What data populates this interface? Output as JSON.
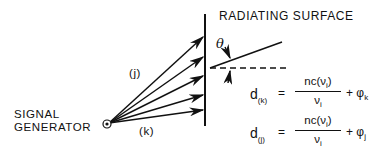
{
  "labels": {
    "surface": "RADIATING SURFACE",
    "generator_line1": "SIGNAL",
    "generator_line2": "GENERATOR",
    "path_j": "(j)",
    "path_k": "(k)",
    "angle": "θ"
  },
  "equations": [
    {
      "lhs": "d",
      "lhs_sub": "(k)",
      "eq": "=",
      "num": "nc(ν",
      "num_sub": "i",
      "num_close": ")",
      "den": "ν",
      "den_sub": "i",
      "plus": "+ φ",
      "phi_sub": "k"
    },
    {
      "lhs": "d",
      "lhs_sub": "(j)",
      "eq": "=",
      "num": "nc(ν",
      "num_sub": "i",
      "num_close": ")",
      "den": "ν",
      "den_sub": "i",
      "plus": "+ φ",
      "phi_sub": "j"
    }
  ],
  "geometry": {
    "source": [
      107,
      124
    ],
    "surface_x": 205,
    "surface_y": [
      14,
      126
    ],
    "arrow_ends": [
      [
        199,
        38
      ],
      [
        199,
        58
      ],
      [
        199,
        77
      ],
      [
        199,
        95
      ],
      [
        199,
        111
      ]
    ]
  }
}
